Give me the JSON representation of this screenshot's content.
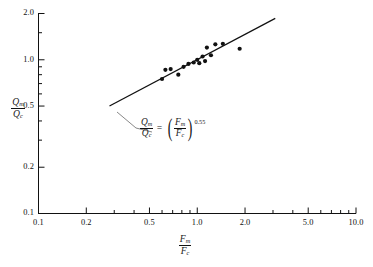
{
  "chart_data": {
    "type": "scatter",
    "title": "",
    "subtitle": "",
    "xlabel": "Fm/Fc",
    "ylabel": "Qm/Qc",
    "xscale": "log",
    "yscale": "log",
    "xlim": [
      0.1,
      10.0
    ],
    "ylim": [
      0.1,
      2.0
    ],
    "grid": false,
    "legend": null,
    "x_tick_labels": [
      "0.1",
      "0.2",
      "0.5",
      "1.0",
      "2.0",
      "5.0",
      "10.0"
    ],
    "x_tick_values": [
      0.1,
      0.2,
      0.5,
      1.0,
      2.0,
      5.0,
      10.0
    ],
    "x_minor_ticks": [
      0.3,
      0.4,
      0.6,
      0.7,
      0.8,
      0.9,
      3.0,
      4.0,
      6.0,
      7.0,
      8.0,
      9.0
    ],
    "y_tick_labels": [
      "0.1",
      "0.2",
      "0.5",
      "1.0",
      "2.0"
    ],
    "y_tick_values": [
      0.1,
      0.2,
      0.5,
      1.0,
      2.0
    ],
    "y_minor_ticks": [
      0.3,
      0.4,
      0.6,
      0.7,
      0.8,
      0.9,
      1.5
    ],
    "series": [
      {
        "name": "test data",
        "marker": "filled-circle",
        "marker_color": "#111111",
        "points": [
          {
            "x": 0.6,
            "y": 0.75
          },
          {
            "x": 0.63,
            "y": 0.86
          },
          {
            "x": 0.68,
            "y": 0.87
          },
          {
            "x": 0.76,
            "y": 0.8
          },
          {
            "x": 0.82,
            "y": 0.9
          },
          {
            "x": 0.88,
            "y": 0.94
          },
          {
            "x": 0.95,
            "y": 0.96
          },
          {
            "x": 1.0,
            "y": 1.0
          },
          {
            "x": 1.03,
            "y": 0.95
          },
          {
            "x": 1.08,
            "y": 1.05
          },
          {
            "x": 1.12,
            "y": 0.98
          },
          {
            "x": 1.15,
            "y": 1.2
          },
          {
            "x": 1.22,
            "y": 1.07
          },
          {
            "x": 1.3,
            "y": 1.26
          },
          {
            "x": 1.45,
            "y": 1.27
          },
          {
            "x": 1.85,
            "y": 1.18
          }
        ]
      }
    ],
    "fit_line": {
      "equation_text": "Qm/Qc = (Fm/Fc)^0.55",
      "exponent": "0.55",
      "numerator_left": "Q",
      "denominator_left": "Q",
      "numerator_right": "F",
      "denominator_right": "F",
      "sub_m": "m",
      "sub_c": "c",
      "x_start": 0.28,
      "y_start": 0.5,
      "x_end": 3.1,
      "y_end": 1.86,
      "color": "#111111"
    }
  },
  "axes": {
    "y_title_num": "Q",
    "y_title_num_sub": "m",
    "y_title_den": "Q",
    "y_title_den_sub": "c",
    "x_title_num": "F",
    "x_title_num_sub": "m",
    "x_title_den": "F",
    "x_title_den_sub": "c"
  },
  "equation": {
    "lhs_num": "Q",
    "lhs_num_sub": "m",
    "lhs_den": "Q",
    "lhs_den_sub": "c",
    "equals": "=",
    "rhs_num": "F",
    "rhs_num_sub": "m",
    "rhs_den": "F",
    "rhs_den_sub": "c",
    "exponent": "0.55"
  }
}
